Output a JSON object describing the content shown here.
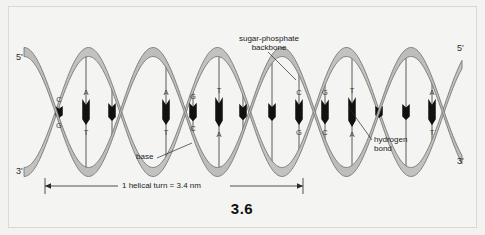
{
  "figure": {
    "number": "3.6",
    "background_color": "#f2f2f0",
    "ribbon_color": "#b9b9b5",
    "ribbon_stroke": "#6f6f6c",
    "bond_color": "#111111",
    "rung_color": "#4a4a4a"
  },
  "end_labels": {
    "left_top": "5'",
    "left_bottom": "3'",
    "right_top": "5'",
    "right_bottom": "3'"
  },
  "callouts": {
    "backbone": "sugar-phosphate\nbackbone",
    "backbone_line1": "sugar-phosphate",
    "backbone_line2": "backbone",
    "base": "base",
    "hydrogen_line1": "hydrogen",
    "hydrogen_line2": "bond"
  },
  "scale": {
    "label": "1 helical turn = 3.4 nm",
    "value": "3.4",
    "unit": "nm"
  },
  "base_pairs": [
    {
      "x": 59,
      "top": "C",
      "bottom": "G",
      "bond_y": 106,
      "bond_h": 30
    },
    {
      "x": 86,
      "top": "A",
      "bottom": "T",
      "bond_y": 92,
      "bond_h": 26
    },
    {
      "x": 112,
      "top": "",
      "bottom": "",
      "bond_y": 84,
      "bond_h": 18
    },
    {
      "x": 166,
      "top": "A",
      "bottom": "T",
      "bond_y": 92,
      "bond_h": 26
    },
    {
      "x": 193,
      "top": "G",
      "bottom": "C",
      "bond_y": 100,
      "bond_h": 30
    },
    {
      "x": 219,
      "top": "T",
      "bottom": "A",
      "bond_y": 120,
      "bond_h": 30
    },
    {
      "x": 243,
      "top": "",
      "bottom": "",
      "bond_y": 132,
      "bond_h": 18
    },
    {
      "x": 272,
      "top": "",
      "bottom": "",
      "bond_y": 132,
      "bond_h": 18
    },
    {
      "x": 299,
      "top": "C",
      "bottom": "G",
      "bond_y": 120,
      "bond_h": 26
    },
    {
      "x": 325,
      "top": "G",
      "bottom": "C",
      "bond_y": 98,
      "bond_h": 32
    },
    {
      "x": 352,
      "top": "T",
      "bottom": "A",
      "bond_y": 92,
      "bond_h": 30
    },
    {
      "x": 379,
      "top": "",
      "bottom": "",
      "bond_y": 80,
      "bond_h": 18
    },
    {
      "x": 406,
      "top": "",
      "bottom": "",
      "bond_y": 82,
      "bond_h": 16
    },
    {
      "x": 432,
      "top": "A",
      "bottom": "T",
      "bond_y": 80,
      "bond_h": 28
    }
  ]
}
